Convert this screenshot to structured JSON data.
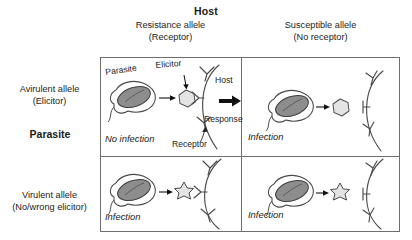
{
  "diagram": {
    "axis_host_label": "Host",
    "axis_parasite_label": "Parasite",
    "columns": [
      {
        "id": "resistance",
        "line1": "Resistance allele",
        "line2": "(Receptor)"
      },
      {
        "id": "susceptible",
        "line1": "Susceptible allele",
        "line2": "(No receptor)"
      }
    ],
    "rows": [
      {
        "id": "avirulent",
        "line1": "Avirulent allele",
        "line2": "(Elicitor)"
      },
      {
        "id": "virulent",
        "line1": "Virulent allele",
        "line2": "(No/wrong elicitor)"
      }
    ],
    "cells": {
      "top_left": {
        "outcome": "No infection",
        "labels": {
          "parasite": "Parasite",
          "elicitor": "Elicitor",
          "host": "Host",
          "response": "Response",
          "receptor": "Receptor"
        },
        "elicitor_shape": "hexagon",
        "receptor_match": "matching",
        "response_arrow": true
      },
      "top_right": {
        "outcome": "Infection",
        "elicitor_shape": "hexagon",
        "receptor_match": "no-receptor",
        "response_arrow": false
      },
      "bottom_left": {
        "outcome": "Infection",
        "elicitor_shape": "star",
        "receptor_match": "matching",
        "response_arrow": false
      },
      "bottom_right": {
        "outcome": "Infection",
        "elicitor_shape": "star",
        "receptor_match": "no-receptor",
        "response_arrow": false
      }
    },
    "colors": {
      "frame": "#6e6e6e",
      "text": "#1a1a1a",
      "parasite_fill": "#8d8d8d",
      "parasite_stroke": "#4a4a4a",
      "elicitor_fill": "#e4e4e4",
      "elicitor_stroke": "#555555",
      "host_stroke": "#4a4a4a",
      "arrow": "#111111"
    }
  }
}
